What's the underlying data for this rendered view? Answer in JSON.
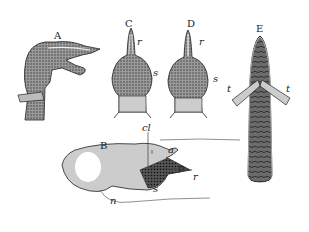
{
  "figure": {
    "panels": [
      {
        "id": "A",
        "label": "A"
      },
      {
        "id": "B",
        "label": "B",
        "parts": [
          "cl",
          "a",
          "p",
          "r",
          "s",
          "n"
        ]
      },
      {
        "id": "C",
        "label": "C",
        "parts": [
          "r",
          "s"
        ]
      },
      {
        "id": "D",
        "label": "D",
        "parts": [
          "r",
          "s"
        ]
      },
      {
        "id": "E",
        "label": "E",
        "parts": [
          "t",
          "t"
        ]
      }
    ],
    "labels": {
      "A": "A",
      "B": "B",
      "C": "C",
      "D": "D",
      "E": "E",
      "C_r": "r",
      "C_s": "s",
      "D_r": "r",
      "D_s": "s",
      "E_t_left": "t",
      "E_t_right": "t",
      "B_cl": "cl",
      "B_a": "a",
      "B_p": "p",
      "B_r": "r",
      "B_s": "s",
      "B_n": "n"
    }
  }
}
